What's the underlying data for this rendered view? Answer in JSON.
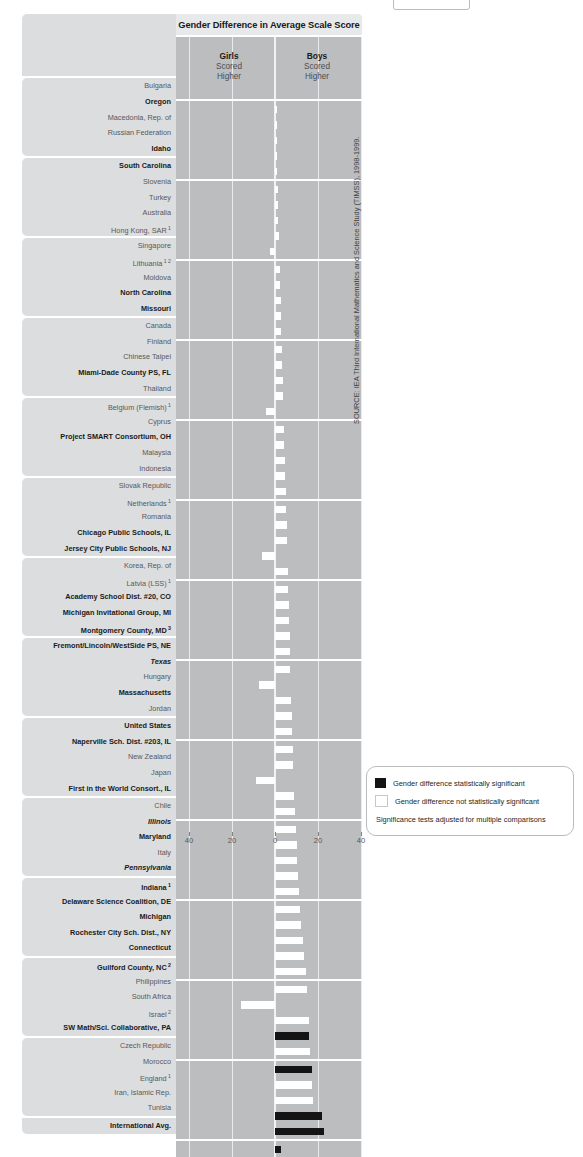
{
  "title": "Gender Difference in Average Scale Score",
  "header": {
    "girls_label": "Girls",
    "girls_line2": "Scored",
    "girls_line3": "Higher",
    "boys_label": "Boys",
    "boys_line2": "Scored",
    "boys_line3": "Higher"
  },
  "source_note": "SOURCE: IEA Third International Mathematics and Science Study (TIMSS), 1998-1999.",
  "legend": {
    "significant": "Gender difference statistically significant",
    "not_significant": "Gender difference not statistically significant",
    "note": "Significance tests adjusted for multiple comparisons"
  },
  "colors": {
    "significant": "#141414",
    "not_significant": "#ffffff",
    "plot_background": "#bbbdbf",
    "label_background": "#dcdddf",
    "title_background": "#e8e9ea"
  },
  "chart_data": {
    "type": "bar",
    "orientation": "horizontal-diverging",
    "title": "Gender Difference in Average Scale Score",
    "xlabel": "",
    "ylabel": "",
    "xlim": [
      -40,
      40
    ],
    "xticks": [
      -40,
      -20,
      0,
      20,
      40
    ],
    "xticklabels": [
      "40",
      "20",
      "0",
      "20",
      "40"
    ],
    "grid": true,
    "legend_position": "bottom-right",
    "note": "Positive values = Boys scored higher; negative values = Girls scored higher",
    "groups": [
      {
        "rows": [
          {
            "label": "Bulgaria",
            "style": "plain",
            "value": 0.3,
            "significant": false
          },
          {
            "label": "Oregon",
            "style": "bold",
            "value": 0.5,
            "significant": false
          },
          {
            "label": "Macedonia, Rep. of",
            "style": "plain",
            "value": 0.6,
            "significant": false
          },
          {
            "label": "Russian Federation",
            "style": "plain",
            "value": 0.8,
            "significant": false
          },
          {
            "label": "Idaho",
            "style": "bold",
            "value": 1.0,
            "significant": false
          }
        ]
      },
      {
        "rows": [
          {
            "label": "South Carolina",
            "style": "bold",
            "value": 1.2,
            "significant": false
          },
          {
            "label": "Slovenia",
            "style": "plain",
            "value": 1.4,
            "significant": false
          },
          {
            "label": "Turkey",
            "style": "plain",
            "value": 1.6,
            "significant": false
          },
          {
            "label": "Australia",
            "style": "plain",
            "value": 1.8,
            "significant": false
          },
          {
            "label": "Hong Kong, SAR",
            "style": "plain",
            "footnote": "1",
            "value": -2.2,
            "significant": false
          }
        ]
      },
      {
        "rows": [
          {
            "label": "Singapore",
            "style": "plain",
            "value": 2.2,
            "significant": false
          },
          {
            "label": "Lithuania",
            "style": "plain",
            "footnote": "1 2",
            "value": 2.4,
            "significant": false
          },
          {
            "label": "Moldova",
            "style": "plain",
            "value": 2.6,
            "significant": false
          },
          {
            "label": "North Carolina",
            "style": "bold",
            "value": 2.8,
            "significant": false
          },
          {
            "label": "Missouri",
            "style": "bold",
            "value": 3.0,
            "significant": false
          }
        ]
      },
      {
        "rows": [
          {
            "label": "Canada",
            "style": "plain",
            "value": 3.2,
            "significant": false
          },
          {
            "label": "Finland",
            "style": "plain",
            "value": 3.4,
            "significant": false
          },
          {
            "label": "Chinese Taipei",
            "style": "plain",
            "value": 3.6,
            "significant": false
          },
          {
            "label": "Miami-Dade County PS, FL",
            "style": "bold",
            "value": 3.8,
            "significant": false
          },
          {
            "label": "Thailand",
            "style": "plain",
            "value": -4.2,
            "significant": false
          }
        ]
      },
      {
        "rows": [
          {
            "label": "Belgium (Flemish)",
            "style": "plain",
            "footnote": "1",
            "value": 4.2,
            "significant": false
          },
          {
            "label": "Cyprus",
            "style": "plain",
            "value": 4.4,
            "significant": false
          },
          {
            "label": "Project SMART Consortium, OH",
            "style": "bold",
            "value": 4.6,
            "significant": false
          },
          {
            "label": "Malaysia",
            "style": "plain",
            "value": 4.8,
            "significant": false
          },
          {
            "label": "Indonesia",
            "style": "plain",
            "value": 5.0,
            "significant": false
          }
        ]
      },
      {
        "rows": [
          {
            "label": "Slovak Republic",
            "style": "plain",
            "value": 5.2,
            "significant": false
          },
          {
            "label": "Netherlands",
            "style": "plain",
            "footnote": "1",
            "value": 5.4,
            "significant": false
          },
          {
            "label": "Romania",
            "style": "plain",
            "value": 5.6,
            "significant": false
          },
          {
            "label": "Chicago Public Schools, IL",
            "style": "bold",
            "value": -6.0,
            "significant": false
          },
          {
            "label": "Jersey City Public Schools, NJ",
            "style": "bold",
            "value": 6.0,
            "significant": false
          }
        ]
      },
      {
        "rows": [
          {
            "label": "Korea, Rep. of",
            "style": "plain",
            "value": 6.2,
            "significant": false
          },
          {
            "label": "Latvia (LSS)",
            "style": "plain",
            "footnote": "1",
            "value": 6.4,
            "significant": false
          },
          {
            "label": "Academy School Dist. #20, CO",
            "style": "bold",
            "value": 6.6,
            "significant": false
          },
          {
            "label": "Michigan Invitational Group, MI",
            "style": "bold",
            "value": 6.8,
            "significant": false
          },
          {
            "label": "Montgomery County, MD",
            "style": "bold",
            "footnote": "3",
            "value": 7.0,
            "significant": false
          }
        ]
      },
      {
        "rows": [
          {
            "label": "Fremont/Lincoln/WestSide PS, NE",
            "style": "bold",
            "value": 7.2,
            "significant": false
          },
          {
            "label": "Texas",
            "style": "italic",
            "value": -7.4,
            "significant": false
          },
          {
            "label": "Hungary",
            "style": "plain",
            "value": 7.6,
            "significant": false
          },
          {
            "label": "Massachusetts",
            "style": "bold",
            "value": 7.8,
            "significant": false
          },
          {
            "label": "Jordan",
            "style": "plain",
            "value": 8.0,
            "significant": false
          }
        ]
      },
      {
        "rows": [
          {
            "label": "United States",
            "style": "bold",
            "value": 8.2,
            "significant": false
          },
          {
            "label": "Naperville Sch. Dist. #203, IL",
            "style": "bold",
            "value": 8.6,
            "significant": false
          },
          {
            "label": "New Zealand",
            "style": "plain",
            "value": -8.8,
            "significant": false
          },
          {
            "label": "Japan",
            "style": "plain",
            "value": 9.0,
            "significant": false
          },
          {
            "label": "First in the World Consort., IL",
            "style": "bold",
            "value": 9.2,
            "significant": false
          }
        ]
      },
      {
        "rows": [
          {
            "label": "Chile",
            "style": "plain",
            "value": 9.6,
            "significant": false
          },
          {
            "label": "Illinois",
            "style": "italic",
            "value": 10.0,
            "significant": false
          },
          {
            "label": "Maryland",
            "style": "bold",
            "value": 10.4,
            "significant": false
          },
          {
            "label": "Italy",
            "style": "plain",
            "value": 10.8,
            "significant": false
          },
          {
            "label": "Pennsylvania",
            "style": "italic",
            "value": 11.2,
            "significant": false
          }
        ]
      },
      {
        "rows": [
          {
            "label": "Indiana",
            "style": "bold",
            "footnote": "1",
            "value": 11.6,
            "significant": false
          },
          {
            "label": "Delaware Science Coalition, DE",
            "style": "bold",
            "value": 12.2,
            "significant": false
          },
          {
            "label": "Michigan",
            "style": "bold",
            "value": 12.8,
            "significant": false
          },
          {
            "label": "Rochester City Sch. Dist., NY",
            "style": "bold",
            "value": 13.4,
            "significant": false
          },
          {
            "label": "Connecticut",
            "style": "bold",
            "value": 14.2,
            "significant": false
          }
        ]
      },
      {
        "rows": [
          {
            "label": "Guilford County, NC",
            "style": "bold",
            "footnote": "2",
            "value": 15.0,
            "significant": false
          },
          {
            "label": "Philippines",
            "style": "plain",
            "value": -15.6,
            "significant": false
          },
          {
            "label": "South Africa",
            "style": "plain",
            "value": 15.8,
            "significant": false
          },
          {
            "label": "Israel",
            "style": "plain",
            "footnote": "2",
            "value": 16.0,
            "significant": true
          },
          {
            "label": "SW Math/Sci. Collaborative, PA",
            "style": "bold",
            "value": 16.4,
            "significant": false
          }
        ]
      },
      {
        "rows": [
          {
            "label": "Czech Republic",
            "style": "plain",
            "value": 17.0,
            "significant": true
          },
          {
            "label": "Morocco",
            "style": "plain",
            "value": 17.4,
            "significant": false
          },
          {
            "label": "England",
            "style": "plain",
            "footnote": "1",
            "value": 17.8,
            "significant": false
          },
          {
            "label": "Iran, Islamic Rep.",
            "style": "plain",
            "value": 22.0,
            "significant": true
          },
          {
            "label": "Tunisia",
            "style": "plain",
            "value": 23.0,
            "significant": true
          }
        ]
      },
      {
        "rows": [
          {
            "label": "International Avg.",
            "style": "bold",
            "value": 2.6,
            "significant": true
          }
        ]
      }
    ]
  }
}
